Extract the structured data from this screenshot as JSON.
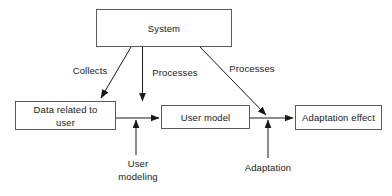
{
  "diagram": {
    "stroke_color": "#5a5a5a",
    "arrow_color": "#1a1a1a",
    "background_color": "#ffffff",
    "nodes": [
      {
        "id": "system",
        "label": "System"
      },
      {
        "id": "data_user",
        "label": "Data related to\nuser"
      },
      {
        "id": "user_model",
        "label": "User model"
      },
      {
        "id": "adapt_effect",
        "label": "Adaptation effect"
      }
    ],
    "edge_labels": [
      {
        "id": "collects",
        "label": "Collects"
      },
      {
        "id": "processes_1",
        "label": "Processes"
      },
      {
        "id": "processes_2",
        "label": "Processes"
      },
      {
        "id": "user_modeling",
        "label": "User\nmodeling"
      },
      {
        "id": "adaptation",
        "label": "Adaptation"
      }
    ]
  }
}
